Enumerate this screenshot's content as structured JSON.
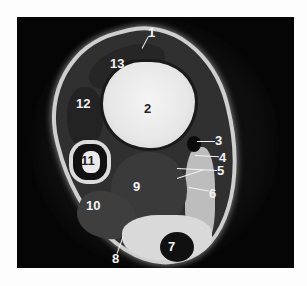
{
  "figure": {
    "type": "axial MRI cross-section (ankle)",
    "background_color": "#fdfdfd",
    "panel_color": "#050505"
  },
  "labels": [
    {
      "id": "1",
      "text": "1"
    },
    {
      "id": "2",
      "text": "2"
    },
    {
      "id": "3",
      "text": "3"
    },
    {
      "id": "4",
      "text": "4"
    },
    {
      "id": "5",
      "text": "5"
    },
    {
      "id": "6",
      "text": "6"
    },
    {
      "id": "7",
      "text": "7"
    },
    {
      "id": "8",
      "text": "8"
    },
    {
      "id": "9",
      "text": "9"
    },
    {
      "id": "10",
      "text": "10"
    },
    {
      "id": "11",
      "text": "11"
    },
    {
      "id": "12",
      "text": "12"
    },
    {
      "id": "13",
      "text": "13"
    }
  ]
}
